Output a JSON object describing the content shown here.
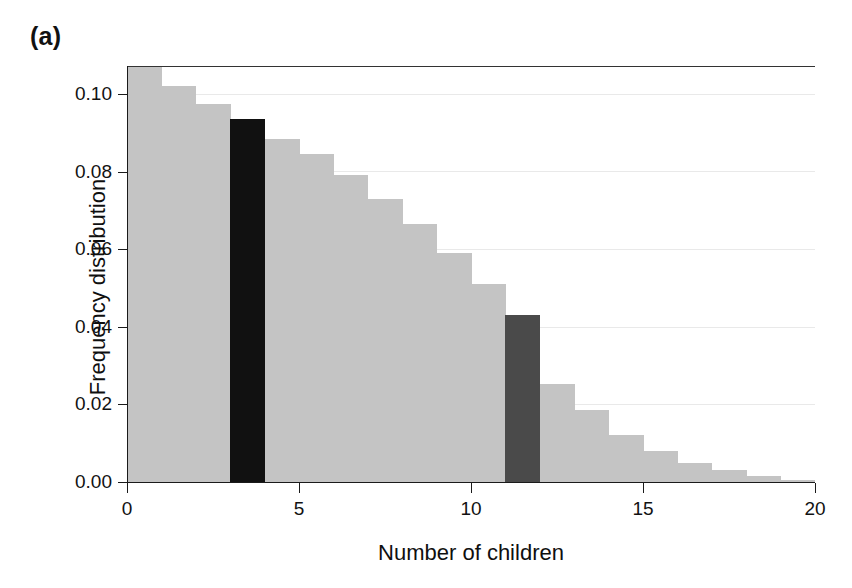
{
  "figure": {
    "panel_label": "(a)"
  },
  "chart_data": {
    "type": "bar",
    "title": "",
    "subtitle": "",
    "xlabel": "Number of children",
    "ylabel": "Frequency distribution",
    "xlim": [
      0,
      20
    ],
    "ylim": [
      0.0,
      0.1073
    ],
    "grid": true,
    "legend": "none",
    "bin_width": 1,
    "x_ticks": [
      0,
      5,
      10,
      15,
      20
    ],
    "x_tick_labels": [
      "0",
      "5",
      "10",
      "15",
      "20"
    ],
    "y_ticks": [
      0.0,
      0.02,
      0.04,
      0.06,
      0.08,
      0.1
    ],
    "y_tick_labels": [
      "0.00",
      "0.02",
      "0.04",
      "0.06",
      "0.08",
      "0.10"
    ],
    "categories": [
      0,
      1,
      2,
      3,
      4,
      5,
      6,
      7,
      8,
      9,
      10,
      11,
      12,
      13,
      14,
      15,
      16,
      17,
      18,
      19
    ],
    "bin_labels": [
      "0-1",
      "1-2",
      "2-3",
      "3-4",
      "4-5",
      "5-6",
      "6-7",
      "7-8",
      "8-9",
      "9-10",
      "10-11",
      "11-12",
      "12-13",
      "13-14",
      "14-15",
      "15-16",
      "16-17",
      "17-18",
      "18-19",
      "19-20"
    ],
    "values": [
      0.1073,
      0.102,
      0.0975,
      0.0935,
      0.0885,
      0.0845,
      0.079,
      0.073,
      0.0665,
      0.059,
      0.051,
      0.043,
      0.0253,
      0.0186,
      0.012,
      0.008,
      0.005,
      0.003,
      0.0016,
      0.0006
    ],
    "bar_colors": [
      "#c4c4c4",
      "#c4c4c4",
      "#c4c4c4",
      "#111111",
      "#c4c4c4",
      "#c4c4c4",
      "#c4c4c4",
      "#c4c4c4",
      "#c4c4c4",
      "#c4c4c4",
      "#c4c4c4",
      "#4a4a4a",
      "#c4c4c4",
      "#c4c4c4",
      "#c4c4c4",
      "#c4c4c4",
      "#c4c4c4",
      "#c4c4c4",
      "#c4c4c4",
      "#c4c4c4"
    ],
    "highlighted_bins": [
      {
        "bin": 3,
        "color": "#111111",
        "value": 0.0935
      },
      {
        "bin": 11,
        "color": "#4a4a4a",
        "value": 0.0253
      }
    ],
    "colors": {
      "bar_default": "#c4c4c4",
      "highlight_dark": "#111111",
      "highlight_mid": "#4a4a4a",
      "axis": "#1a1a1a",
      "grid": "#e9e9e9",
      "background": "#ffffff"
    },
    "note": "Bar at bin 0 is clipped by the top of the plotting box."
  }
}
